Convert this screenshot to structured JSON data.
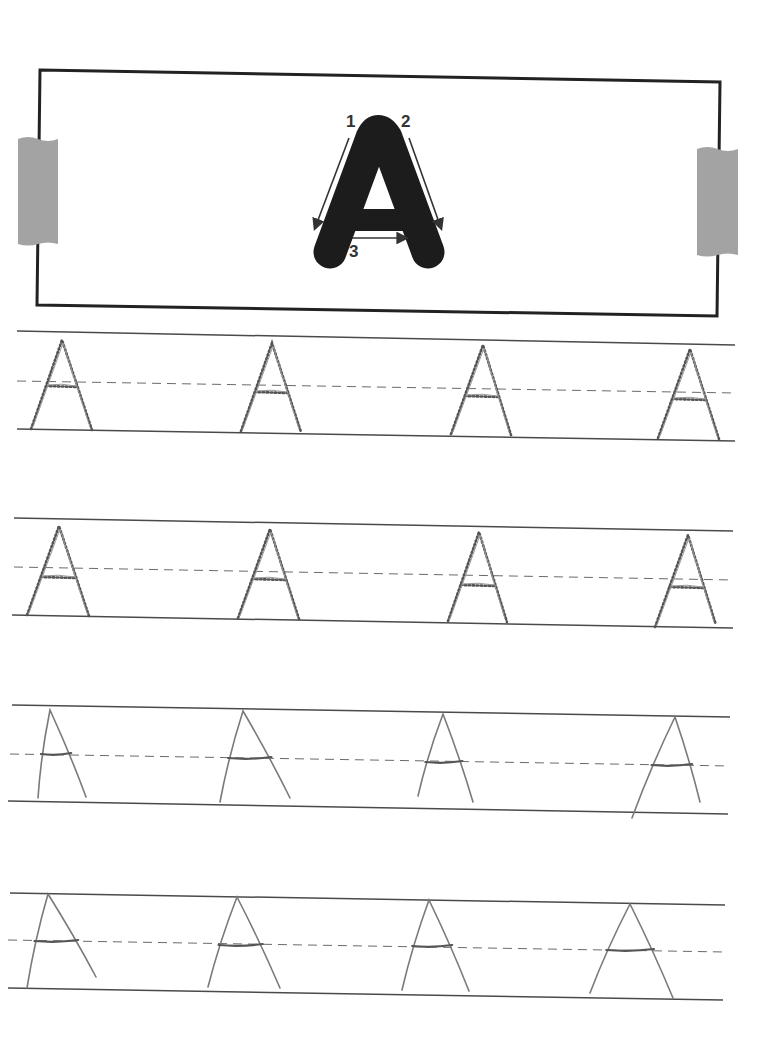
{
  "worksheet": {
    "letter": "A",
    "stroke_order": [
      {
        "number": "1",
        "label_pos": [
          351,
          127
        ],
        "arrow": [
          [
            349,
            138
          ],
          [
            315,
            228
          ]
        ]
      },
      {
        "number": "2",
        "label_pos": [
          407,
          127
        ],
        "arrow": [
          [
            409,
            138
          ],
          [
            441,
            228
          ]
        ]
      },
      {
        "number": "3",
        "label_pos": [
          356,
          257
        ],
        "arrow": [
          [
            352,
            238
          ],
          [
            406,
            238
          ]
        ]
      }
    ],
    "colors": {
      "ink": "#222222",
      "line": "#4a4a4a",
      "dashed": "#6a6a6a",
      "pencil": "#7a7a7a",
      "tape": "#a3a3a3",
      "letter_fill": "#1c1c1c"
    },
    "box": {
      "corners": [
        [
          40,
          70
        ],
        [
          720,
          82
        ],
        [
          717,
          316
        ],
        [
          37,
          305
        ]
      ]
    },
    "tapes": [
      {
        "side": "left",
        "x": 18,
        "y": 137,
        "w": 40,
        "h": 107
      },
      {
        "side": "right",
        "x": 697,
        "y": 147,
        "w": 41,
        "h": 108
      }
    ],
    "rows": [
      {
        "style": "traced-dotted",
        "top": [
          [
            17,
            331
          ],
          [
            735,
            345
          ]
        ],
        "mid": [
          [
            17,
            381
          ],
          [
            735,
            393
          ]
        ],
        "bottom": [
          [
            17,
            429
          ],
          [
            735,
            441
          ]
        ],
        "letters": [
          {
            "apex": [
              62,
              340
            ],
            "left_foot": [
              31,
              429
            ],
            "right_foot": [
              92,
              430
            ],
            "bar_y": 386
          },
          {
            "apex": [
              272,
              343
            ],
            "left_foot": [
              241,
              431
            ],
            "right_foot": [
              301,
              432
            ],
            "bar_y": 392
          },
          {
            "apex": [
              483,
              345
            ],
            "left_foot": [
              451,
              434
            ],
            "right_foot": [
              511,
              435
            ],
            "bar_y": 396
          },
          {
            "apex": [
              690,
              349
            ],
            "left_foot": [
              658,
              438
            ],
            "right_foot": [
              719,
              439
            ],
            "bar_y": 399
          }
        ]
      },
      {
        "style": "traced-dotted",
        "top": [
          [
            14,
            518
          ],
          [
            733,
            531
          ]
        ],
        "mid": [
          [
            14,
            567
          ],
          [
            733,
            580
          ]
        ],
        "bottom": [
          [
            12,
            615
          ],
          [
            733,
            628
          ]
        ],
        "letters": [
          {
            "apex": [
              59,
              526
            ],
            "left_foot": [
              27,
              615
            ],
            "right_foot": [
              89,
              616
            ],
            "bar_y": 577
          },
          {
            "apex": [
              270,
              529
            ],
            "left_foot": [
              238,
              618
            ],
            "right_foot": [
              299,
              619
            ],
            "bar_y": 579
          },
          {
            "apex": [
              479,
              532
            ],
            "left_foot": [
              448,
              621
            ],
            "right_foot": [
              507,
              622
            ],
            "bar_y": 585
          },
          {
            "apex": [
              688,
              535
            ],
            "left_foot": [
              655,
              627
            ],
            "right_foot": [
              716,
              625
            ],
            "bar_y": 587
          }
        ]
      },
      {
        "style": "freehand",
        "top": [
          [
            12,
            705
          ],
          [
            730,
            717
          ]
        ],
        "mid": [
          [
            10,
            754
          ],
          [
            730,
            766
          ]
        ],
        "bottom": [
          [
            8,
            801
          ],
          [
            728,
            814
          ]
        ],
        "letters": [
          {
            "apex": [
              50,
              710
            ],
            "left_foot": [
              38,
              798
            ],
            "right_foot": [
              86,
              797
            ],
            "bar_y": 754
          },
          {
            "apex": [
              243,
              711
            ],
            "left_foot": [
              220,
              802
            ],
            "right_foot": [
              290,
              798
            ],
            "bar_y": 758
          },
          {
            "apex": [
              443,
              714
            ],
            "left_foot": [
              418,
              796
            ],
            "right_foot": [
              473,
              802
            ],
            "bar_y": 762
          },
          {
            "apex": [
              675,
              717
            ],
            "left_foot": [
              632,
              818
            ],
            "right_foot": [
              700,
              802
            ],
            "bar_y": 765
          }
        ]
      },
      {
        "style": "freehand",
        "top": [
          [
            10,
            893
          ],
          [
            725,
            905
          ]
        ],
        "mid": [
          [
            8,
            940
          ],
          [
            725,
            952
          ]
        ],
        "bottom": [
          [
            8,
            988
          ],
          [
            723,
            1000
          ]
        ],
        "letters": [
          {
            "apex": [
              48,
              894
            ],
            "left_foot": [
              27,
              988
            ],
            "right_foot": [
              96,
              977
            ],
            "bar_y": 941
          },
          {
            "apex": [
              237,
              897
            ],
            "left_foot": [
              208,
              987
            ],
            "right_foot": [
              280,
              988
            ],
            "bar_y": 945
          },
          {
            "apex": [
              429,
              900
            ],
            "left_foot": [
              402,
              990
            ],
            "right_foot": [
              469,
              991
            ],
            "bar_y": 946
          },
          {
            "apex": [
              630,
              904
            ],
            "left_foot": [
              590,
              993
            ],
            "right_foot": [
              673,
              998
            ],
            "bar_y": 950
          }
        ]
      }
    ]
  }
}
